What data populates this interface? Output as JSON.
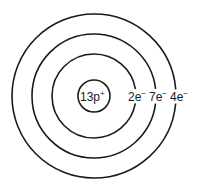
{
  "diagram": {
    "type": "bohr-model",
    "element_protons": "13p",
    "proton_charge": "+",
    "shells": [
      {
        "label": "2e",
        "charge": "−",
        "radius": 42
      },
      {
        "label": "7e",
        "charge": "−",
        "radius": 62
      },
      {
        "label": "4e",
        "charge": "−",
        "radius": 82
      }
    ],
    "nucleus_radius": 16,
    "center": {
      "x": 94,
      "y": 96
    },
    "stroke_color": "#1a1a1a"
  }
}
